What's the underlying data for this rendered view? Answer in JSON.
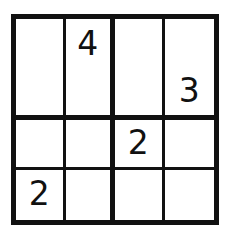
{
  "puzzle": {
    "kind": "sudoku-4x4",
    "size": 4,
    "box_rows": 2,
    "box_cols": 2,
    "ink_color": "#111111",
    "background_color": "#ffffff",
    "rows": [
      [
        {
          "value": "",
          "given": false
        },
        {
          "value": "4",
          "given": true
        },
        {
          "value": "",
          "given": false
        },
        {
          "value": "",
          "given": false
        }
      ],
      [
        {
          "value": "",
          "given": false
        },
        {
          "value": "",
          "given": false
        },
        {
          "value": "",
          "given": false
        },
        {
          "value": "3",
          "given": true
        }
      ],
      [
        {
          "value": "",
          "given": false
        },
        {
          "value": "",
          "given": false
        },
        {
          "value": "2",
          "given": true
        },
        {
          "value": "",
          "given": false
        }
      ],
      [
        {
          "value": "2",
          "given": true
        },
        {
          "value": "",
          "given": false
        },
        {
          "value": "",
          "given": false
        },
        {
          "value": "",
          "given": false
        }
      ]
    ]
  }
}
